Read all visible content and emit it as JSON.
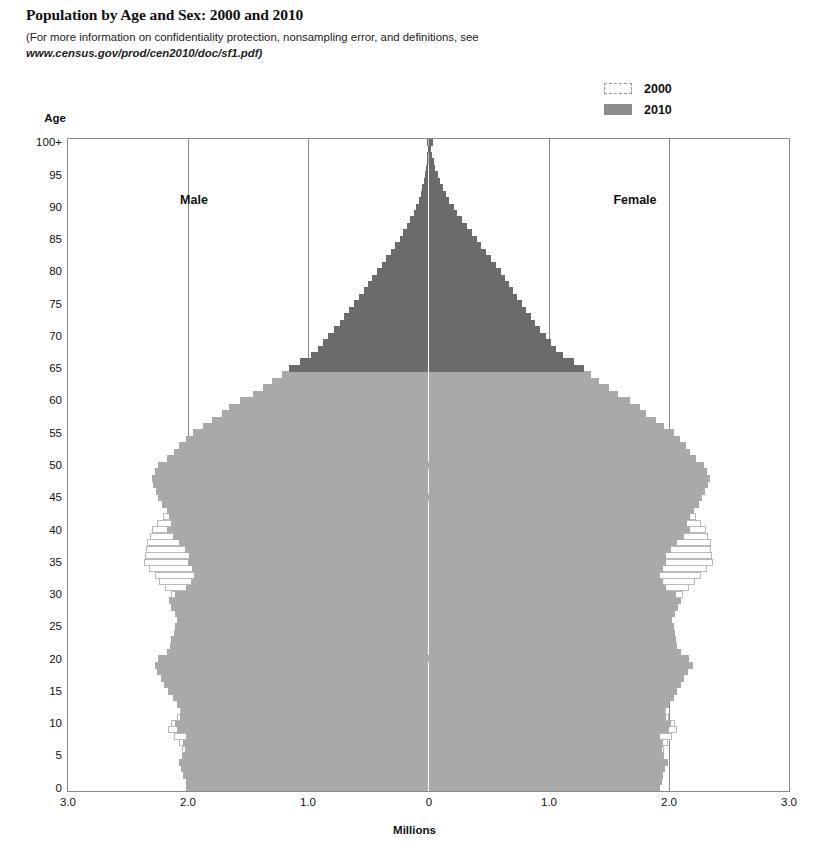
{
  "title": "Population by Age and Sex: 2000 and 2010",
  "subtitle_line1": "(For more information on confidentiality protection, nonsampling error, and definitions, see",
  "subtitle_url": "www.census.gov/prod/cen2010/doc/sf1.pdf)",
  "legend": {
    "items": [
      {
        "label": "2000",
        "swatch": "outline-dashed-swatch",
        "color": "#ffffff"
      },
      {
        "label": "2010",
        "swatch": "filled-gray-swatch",
        "color": "#8c8c8c"
      }
    ]
  },
  "axes": {
    "y_title": "Age",
    "x_title": "Millions",
    "y_ticks": [
      "100+",
      "95",
      "90",
      "85",
      "80",
      "75",
      "70",
      "65",
      "60",
      "55",
      "50",
      "45",
      "40",
      "35",
      "30",
      "25",
      "20",
      "15",
      "10",
      "5",
      "0"
    ],
    "x_ticks": [
      "3.0",
      "2.0",
      "1.0",
      "0",
      "1.0",
      "2.0",
      "3.0"
    ]
  },
  "quadrant_labels": {
    "left": "Male",
    "right": "Female"
  },
  "colors": {
    "bars_2010_under65": "#a9a9a9",
    "bars_2010_65plus": "#6b6b6b",
    "bars_2000_outline": "#b9b9b9",
    "gridline": "#8a8a8a",
    "plot_border": "#8a8a8a"
  },
  "chart_data": {
    "type": "bar",
    "subtype": "population-pyramid",
    "title": "Population by Age and Sex: 2000 and 2010",
    "xlabel": "Millions",
    "ylabel": "Age",
    "xlim": [
      -3.0,
      3.0
    ],
    "x_abs_ticks": [
      3.0,
      2.0,
      1.0,
      0,
      1.0,
      2.0,
      3.0
    ],
    "ylim": [
      0,
      100
    ],
    "grid": "vertical",
    "legend_position": "top-right",
    "age_unit": "single-year, 0 to 100+",
    "dark_shade_threshold_age": 65,
    "note": "Values are millions of people per single year of age. Left side = Male, right side = Female.",
    "ages": [
      0,
      1,
      2,
      3,
      4,
      5,
      6,
      7,
      8,
      9,
      10,
      11,
      12,
      13,
      14,
      15,
      16,
      17,
      18,
      19,
      20,
      21,
      22,
      23,
      24,
      25,
      26,
      27,
      28,
      29,
      30,
      31,
      32,
      33,
      34,
      35,
      36,
      37,
      38,
      39,
      40,
      41,
      42,
      43,
      44,
      45,
      46,
      47,
      48,
      49,
      50,
      51,
      52,
      53,
      54,
      55,
      56,
      57,
      58,
      59,
      60,
      61,
      62,
      63,
      64,
      65,
      66,
      67,
      68,
      69,
      70,
      71,
      72,
      73,
      74,
      75,
      76,
      77,
      78,
      79,
      80,
      81,
      82,
      83,
      84,
      85,
      86,
      87,
      88,
      89,
      90,
      91,
      92,
      93,
      94,
      95,
      96,
      97,
      98,
      99,
      100
    ],
    "series": [
      {
        "name": "2010 Male",
        "side": "left",
        "values": [
          2.02,
          2.02,
          2.04,
          2.06,
          2.08,
          2.05,
          2.03,
          2.04,
          2.02,
          2.09,
          2.11,
          2.07,
          2.06,
          2.09,
          2.13,
          2.17,
          2.2,
          2.23,
          2.26,
          2.28,
          2.25,
          2.18,
          2.15,
          2.14,
          2.12,
          2.11,
          2.09,
          2.11,
          2.14,
          2.16,
          2.11,
          2.02,
          1.98,
          1.95,
          1.97,
          2.0,
          1.99,
          2.03,
          2.08,
          2.13,
          2.18,
          2.14,
          2.16,
          2.18,
          2.22,
          2.25,
          2.27,
          2.29,
          2.3,
          2.28,
          2.25,
          2.18,
          2.12,
          2.08,
          2.02,
          1.96,
          1.88,
          1.8,
          1.72,
          1.66,
          1.57,
          1.46,
          1.38,
          1.3,
          1.22,
          1.16,
          1.07,
          0.98,
          0.92,
          0.88,
          0.84,
          0.79,
          0.74,
          0.7,
          0.66,
          0.62,
          0.58,
          0.54,
          0.5,
          0.47,
          0.43,
          0.39,
          0.35,
          0.31,
          0.28,
          0.24,
          0.21,
          0.18,
          0.15,
          0.12,
          0.1,
          0.08,
          0.065,
          0.05,
          0.04,
          0.03,
          0.022,
          0.016,
          0.011,
          0.008,
          0.012
        ]
      },
      {
        "name": "2010 Female",
        "side": "right",
        "values": [
          1.93,
          1.94,
          1.95,
          1.97,
          1.99,
          1.96,
          1.94,
          1.95,
          1.93,
          2.0,
          2.02,
          1.98,
          1.97,
          2.0,
          2.04,
          2.07,
          2.1,
          2.13,
          2.16,
          2.2,
          2.17,
          2.1,
          2.07,
          2.06,
          2.05,
          2.04,
          2.03,
          2.05,
          2.08,
          2.1,
          2.06,
          1.98,
          1.95,
          1.93,
          1.95,
          1.98,
          1.98,
          2.02,
          2.07,
          2.13,
          2.18,
          2.15,
          2.18,
          2.21,
          2.25,
          2.28,
          2.3,
          2.33,
          2.34,
          2.32,
          2.29,
          2.23,
          2.18,
          2.14,
          2.09,
          2.04,
          1.96,
          1.89,
          1.81,
          1.76,
          1.68,
          1.58,
          1.5,
          1.42,
          1.35,
          1.29,
          1.21,
          1.12,
          1.06,
          1.02,
          0.98,
          0.93,
          0.89,
          0.85,
          0.81,
          0.78,
          0.74,
          0.7,
          0.67,
          0.64,
          0.6,
          0.56,
          0.52,
          0.48,
          0.44,
          0.4,
          0.36,
          0.32,
          0.28,
          0.24,
          0.21,
          0.17,
          0.145,
          0.12,
          0.095,
          0.075,
          0.055,
          0.042,
          0.03,
          0.022,
          0.035
        ]
      },
      {
        "name": "2000 Male",
        "side": "left",
        "values": [
          1.95,
          1.98,
          1.99,
          2.0,
          2.02,
          2.03,
          2.05,
          2.08,
          2.12,
          2.17,
          2.14,
          2.09,
          2.07,
          2.05,
          2.03,
          2.04,
          2.03,
          2.02,
          2.0,
          1.97,
          1.92,
          1.88,
          1.85,
          1.84,
          1.86,
          1.9,
          1.93,
          1.98,
          2.03,
          2.09,
          2.14,
          2.19,
          2.24,
          2.28,
          2.33,
          2.37,
          2.36,
          2.35,
          2.34,
          2.32,
          2.3,
          2.26,
          2.21,
          2.16,
          2.1,
          2.03,
          1.96,
          1.9,
          1.84,
          1.78,
          1.7,
          1.62,
          1.55,
          1.48,
          1.4,
          1.33,
          1.26,
          1.2,
          1.15,
          1.1,
          1.06,
          1.02,
          0.98,
          0.95,
          0.92,
          0.89,
          0.86,
          0.83,
          0.8,
          0.77,
          0.74,
          0.71,
          0.67,
          0.64,
          0.6,
          0.56,
          0.52,
          0.48,
          0.44,
          0.4,
          0.36,
          0.32,
          0.28,
          0.25,
          0.21,
          0.18,
          0.15,
          0.12,
          0.1,
          0.08,
          0.062,
          0.048,
          0.036,
          0.027,
          0.02,
          0.014,
          0.01,
          0.007,
          0.005,
          0.0035,
          0.0055
        ]
      },
      {
        "name": "2000 Female",
        "side": "right",
        "values": [
          1.86,
          1.89,
          1.9,
          1.91,
          1.93,
          1.94,
          1.96,
          1.99,
          2.03,
          2.07,
          2.05,
          2.0,
          1.98,
          1.96,
          1.94,
          1.95,
          1.94,
          1.93,
          1.92,
          1.9,
          1.86,
          1.82,
          1.8,
          1.79,
          1.81,
          1.85,
          1.89,
          1.94,
          1.99,
          2.06,
          2.12,
          2.17,
          2.22,
          2.27,
          2.32,
          2.37,
          2.36,
          2.35,
          2.35,
          2.33,
          2.31,
          2.27,
          2.23,
          2.18,
          2.12,
          2.06,
          1.99,
          1.94,
          1.88,
          1.82,
          1.75,
          1.67,
          1.6,
          1.54,
          1.46,
          1.39,
          1.33,
          1.28,
          1.23,
          1.19,
          1.16,
          1.12,
          1.09,
          1.07,
          1.04,
          1.02,
          1.0,
          0.97,
          0.95,
          0.93,
          0.91,
          0.88,
          0.85,
          0.82,
          0.78,
          0.75,
          0.71,
          0.67,
          0.63,
          0.59,
          0.55,
          0.5,
          0.46,
          0.42,
          0.37,
          0.33,
          0.29,
          0.25,
          0.21,
          0.18,
          0.145,
          0.118,
          0.094,
          0.073,
          0.055,
          0.041,
          0.03,
          0.021,
          0.015,
          0.01,
          0.017
        ]
      }
    ]
  }
}
